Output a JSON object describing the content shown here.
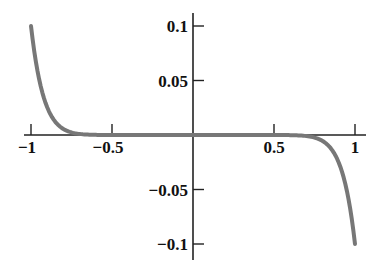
{
  "chart_data": {
    "type": "line",
    "title": "",
    "xlabel": "",
    "ylabel": "",
    "xlim": [
      -1,
      1
    ],
    "ylim": [
      -0.1,
      0.1
    ],
    "grid": false,
    "legend": null,
    "x_ticks": [
      -1,
      -0.5,
      0.5,
      1
    ],
    "x_tick_labels": [
      "−1",
      "−0.5",
      "0.5",
      "1"
    ],
    "y_ticks": [
      0.1,
      0.05,
      -0.05,
      -0.1
    ],
    "y_tick_labels": [
      "0.1",
      "0.05",
      "−0.05",
      "−0.1"
    ],
    "series": [
      {
        "name": "f(x)",
        "color": "#777777",
        "x": [
          -1,
          -0.95,
          -0.9,
          -0.85,
          -0.8,
          -0.75,
          -0.7,
          -0.6,
          -0.5,
          -0.25,
          0,
          0.25,
          0.5,
          0.6,
          0.7,
          0.75,
          0.8,
          0.85,
          0.9,
          0.95,
          1
        ],
        "values": [
          0.1,
          0.0513,
          0.0254,
          0.0121,
          0.0055,
          0.0024,
          0.001,
          0.0001,
          0.0,
          0.0,
          0.0,
          0.0,
          0.0,
          -0.0001,
          -0.001,
          -0.0024,
          -0.0055,
          -0.0121,
          -0.0254,
          -0.0513,
          -0.1
        ]
      }
    ]
  }
}
